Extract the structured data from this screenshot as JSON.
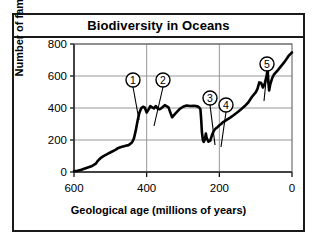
{
  "figure": {
    "title": "Biodiversity in Oceans",
    "frame_color": "#1a1a1a",
    "background": "#ffffff"
  },
  "chart_data": {
    "type": "line",
    "title": "Biodiversity in Oceans",
    "subtitle": "",
    "xlabel": "Geological age (millions of years)",
    "ylabel": "Number of families",
    "xlim": [
      600,
      0
    ],
    "ylim": [
      0,
      800
    ],
    "x_reversed": true,
    "grid": "both",
    "legend": "none",
    "xticks": [
      600,
      400,
      200,
      0
    ],
    "yticks": [
      0,
      200,
      400,
      600,
      800
    ],
    "line_color": "#000000",
    "series": [
      {
        "name": "Number of marine families",
        "x": [
          600,
          590,
          580,
          570,
          560,
          550,
          540,
          535,
          530,
          525,
          520,
          515,
          510,
          505,
          500,
          495,
          490,
          485,
          480,
          470,
          460,
          450,
          445,
          440,
          435,
          430,
          425,
          420,
          415,
          410,
          405,
          400,
          395,
          390,
          385,
          380,
          375,
          370,
          365,
          360,
          355,
          350,
          340,
          330,
          320,
          310,
          300,
          290,
          280,
          270,
          260,
          255,
          252,
          250,
          248,
          245,
          243,
          240,
          237,
          235,
          230,
          225,
          220,
          215,
          210,
          205,
          200,
          195,
          190,
          185,
          180,
          170,
          160,
          150,
          140,
          130,
          120,
          110,
          100,
          95,
          90,
          85,
          80,
          75,
          70,
          67,
          65,
          63,
          60,
          55,
          50,
          40,
          30,
          20,
          10,
          0
        ],
        "y": [
          5,
          8,
          14,
          22,
          30,
          38,
          52,
          68,
          80,
          90,
          98,
          104,
          110,
          116,
          122,
          128,
          134,
          140,
          148,
          156,
          162,
          168,
          176,
          186,
          210,
          260,
          320,
          370,
          398,
          408,
          402,
          372,
          390,
          412,
          404,
          398,
          412,
          398,
          392,
          398,
          408,
          418,
          404,
          342,
          368,
          392,
          408,
          416,
          412,
          414,
          410,
          402,
          392,
          330,
          250,
          196,
          188,
          202,
          240,
          214,
          190,
          196,
          232,
          258,
          272,
          280,
          292,
          300,
          312,
          318,
          326,
          340,
          356,
          374,
          392,
          412,
          436,
          470,
          498,
          520,
          560,
          556,
          528,
          552,
          602,
          640,
          560,
          510,
          546,
          584,
          608,
          634,
          662,
          690,
          724,
          748
        ]
      }
    ],
    "annotations": [
      {
        "id": 1,
        "label": "1",
        "circle_x": 131,
        "circle_y": 78,
        "point_x": 137,
        "point_y": 118,
        "description": "End-Ordovician extinction dip"
      },
      {
        "id": 2,
        "label": "2",
        "circle_x": 161,
        "circle_y": 78,
        "point_x": 152,
        "point_y": 124,
        "description": "Late Devonian extinction dip"
      },
      {
        "id": 3,
        "label": "3",
        "circle_x": 208,
        "circle_y": 96,
        "point_x": 213,
        "point_y": 143,
        "description": "End-Permian extinction dip"
      },
      {
        "id": 4,
        "label": "4",
        "circle_x": 224,
        "circle_y": 103,
        "point_x": 219,
        "point_y": 145,
        "description": "End-Triassic extinction dip"
      },
      {
        "id": 5,
        "label": "5",
        "circle_x": 265,
        "circle_y": 62,
        "point_x": 262,
        "point_y": 99,
        "description": "End-Cretaceous extinction dip"
      }
    ]
  }
}
